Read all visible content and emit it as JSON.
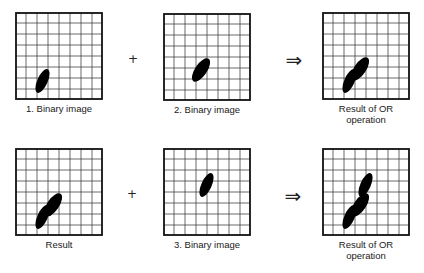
{
  "diagram": {
    "grid": {
      "cols": 8,
      "rows": 8,
      "size": 88
    },
    "colors": {
      "background": "#ffffff",
      "grid_line": "#3a3a3a",
      "border": "#111111",
      "blob": "#000000",
      "label_text": "#1a1a1a"
    },
    "blobs": {
      "blob1": {
        "cx": 27.5,
        "cy": 69,
        "rx": 5.2,
        "ry": 12.8,
        "rotate": 24
      },
      "blob2": {
        "cx": 38,
        "cy": 57,
        "rx": 6,
        "ry": 13.5,
        "rotate": 34
      },
      "blob3": {
        "cx": 43.5,
        "cy": 37,
        "rx": 5.2,
        "ry": 12.8,
        "rotate": 24
      }
    },
    "panels": [
      {
        "label": "1. Binary image",
        "blobs": [
          "blob1"
        ]
      },
      {
        "label": "2. Binary image",
        "blobs": [
          "blob2"
        ]
      },
      {
        "label": "Result of OR operation",
        "blobs": [
          "blob1",
          "blob2"
        ]
      },
      {
        "label": "Result",
        "blobs": [
          "blob1",
          "blob2"
        ]
      },
      {
        "label": "3. Binary image",
        "blobs": [
          "blob3"
        ]
      },
      {
        "label": "Result of OR operation",
        "blobs": [
          "blob1",
          "blob2",
          "blob3"
        ]
      }
    ],
    "operators": {
      "plus": "+",
      "arrow": "⇒"
    }
  }
}
